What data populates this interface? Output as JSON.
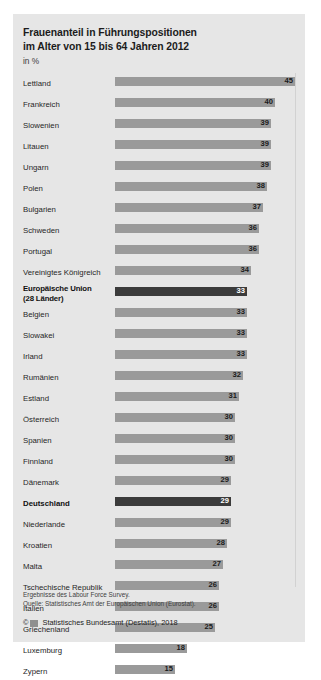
{
  "header": {
    "title_line1": "Frauenanteil in Führungspositionen",
    "title_line2": "im Alter von 15 bis 64 Jahren 2012",
    "subtitle": "in %"
  },
  "footer": {
    "source_line1": "Ergebnisse des Labour Force Survey.",
    "source_line2": "Quelle: Statistisches Amt der Europäischen Union (Eurostat).",
    "copyright_symbol": "©",
    "logo_name": "destatis-logo",
    "copyright_text": "Statistisches Bundesamt (Destatis), 2018"
  },
  "chart_data": {
    "type": "bar",
    "orientation": "horizontal",
    "title": "Frauenanteil in Führungspositionen im Alter von 15 bis 64 Jahren 2012",
    "xlabel": "",
    "ylabel": "",
    "unit": "in %",
    "xlim": [
      0,
      45
    ],
    "grid": true,
    "gridline_values": [
      45
    ],
    "legend": "none",
    "categories": [
      "Lettland",
      "Frankreich",
      "Slowenien",
      "Litauen",
      "Ungarn",
      "Polen",
      "Bulgarien",
      "Schweden",
      "Portugal",
      "Vereinigtes Königreich",
      "Europäische Union\n(28 Länder)",
      "Belgien",
      "Slowakei",
      "Irland",
      "Rumänien",
      "Estland",
      "Österreich",
      "Spanien",
      "Finnland",
      "Dänemark",
      "Deutschland",
      "Niederlande",
      "Kroatien",
      "Malta",
      "Tschechische Republik",
      "Italien",
      "Griechenland",
      "Luxemburg",
      "Zypern"
    ],
    "values": [
      45,
      40,
      39,
      39,
      39,
      38,
      37,
      36,
      36,
      34,
      33,
      33,
      33,
      33,
      32,
      31,
      30,
      30,
      30,
      29,
      29,
      29,
      28,
      27,
      26,
      26,
      25,
      18,
      15
    ],
    "highlighted": [
      "Europäische Union\n(28 Länder)",
      "Deutschland"
    ],
    "colors": {
      "bar": "#9a9a9a",
      "bar_highlight": "#3b3b3b",
      "panel_background": "#e6e6e6",
      "value_label": "#1b1b1b",
      "value_label_highlight": "#ffffff"
    }
  }
}
